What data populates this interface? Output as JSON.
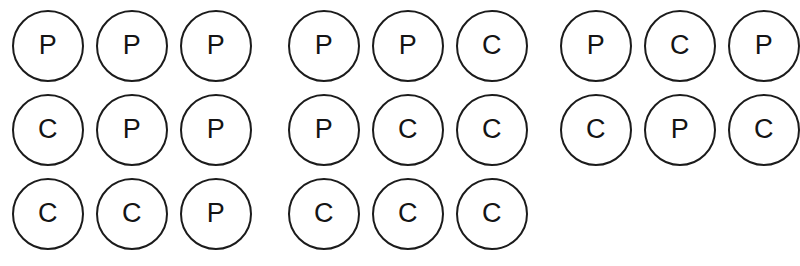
{
  "page": {
    "background_color": "#ffffff",
    "width": 795,
    "height": 266
  },
  "style": {
    "circle_stroke_color": "#1b1b1b",
    "circle_fill_color": "#ffffff",
    "letter_color": "#141414",
    "circle_diameter_px": 72,
    "circle_stroke_px": 2
  },
  "legend": {
    "P": "P",
    "C": "C"
  },
  "groups": [
    {
      "name": "group-1",
      "rows": [
        {
          "cells": [
            {
              "label": "P"
            },
            {
              "label": "P"
            },
            {
              "label": "P"
            }
          ]
        },
        {
          "cells": [
            {
              "label": "C"
            },
            {
              "label": "P"
            },
            {
              "label": "P"
            }
          ]
        },
        {
          "cells": [
            {
              "label": "C"
            },
            {
              "label": "C"
            },
            {
              "label": "P"
            }
          ]
        }
      ]
    },
    {
      "name": "group-2",
      "rows": [
        {
          "cells": [
            {
              "label": "P"
            },
            {
              "label": "P"
            },
            {
              "label": "C"
            }
          ]
        },
        {
          "cells": [
            {
              "label": "P"
            },
            {
              "label": "C"
            },
            {
              "label": "C"
            }
          ]
        },
        {
          "cells": [
            {
              "label": "C"
            },
            {
              "label": "C"
            },
            {
              "label": "C"
            }
          ]
        }
      ]
    },
    {
      "name": "group-3",
      "rows": [
        {
          "cells": [
            {
              "label": "P"
            },
            {
              "label": "C"
            },
            {
              "label": "P"
            }
          ]
        },
        {
          "cells": [
            {
              "label": "C"
            },
            {
              "label": "P"
            },
            {
              "label": "C"
            }
          ]
        }
      ]
    }
  ]
}
